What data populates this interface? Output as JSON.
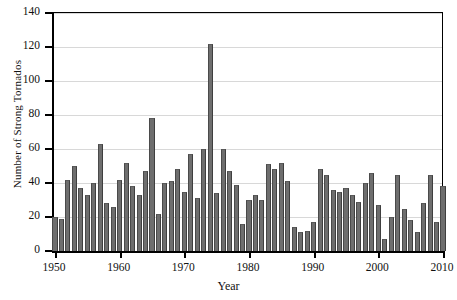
{
  "chart_data": {
    "type": "bar",
    "title": "",
    "xlabel": "Year",
    "ylabel": "Number of Strong Tornados",
    "xlim": [
      1950,
      2010
    ],
    "ylim": [
      0,
      140
    ],
    "ytick_values": [
      0,
      20,
      40,
      60,
      80,
      100,
      120,
      140
    ],
    "ytick_labels": [
      "0",
      "20",
      "40",
      "60",
      "80",
      "100",
      "120",
      "140"
    ],
    "xtick_values": [
      1950,
      1960,
      1970,
      1980,
      1990,
      2000,
      2010
    ],
    "xtick_labels": [
      "1950",
      "1960",
      "1970",
      "1980",
      "1990",
      "2000",
      "2010"
    ],
    "grid": "horizontal",
    "legend": "none",
    "bar_color": "#6e6e6e",
    "categories": [
      1950,
      1951,
      1952,
      1953,
      1954,
      1955,
      1956,
      1957,
      1958,
      1959,
      1960,
      1961,
      1962,
      1963,
      1964,
      1965,
      1966,
      1967,
      1968,
      1969,
      1970,
      1971,
      1972,
      1973,
      1974,
      1975,
      1976,
      1977,
      1978,
      1979,
      1980,
      1981,
      1982,
      1983,
      1984,
      1985,
      1986,
      1987,
      1988,
      1989,
      1990,
      1991,
      1992,
      1993,
      1994,
      1995,
      1996,
      1997,
      1998,
      1999,
      2000,
      2001,
      2002,
      2003,
      2004,
      2005,
      2006,
      2007,
      2008,
      2009,
      2010
    ],
    "values": [
      20,
      19,
      42,
      50,
      37,
      33,
      40,
      63,
      28,
      26,
      42,
      52,
      38,
      33,
      47,
      78,
      22,
      40,
      41,
      48,
      35,
      57,
      31,
      60,
      122,
      34,
      60,
      47,
      39,
      16,
      30,
      33,
      30,
      51,
      48,
      52,
      41,
      14,
      11,
      12,
      17,
      48,
      45,
      36,
      35,
      37,
      33,
      29,
      40,
      46,
      27,
      7,
      20,
      45,
      25,
      18,
      11,
      28,
      45,
      17,
      38
    ]
  },
  "axis": {
    "y_title": "Number of Strong Tornados",
    "x_title": "Year"
  }
}
